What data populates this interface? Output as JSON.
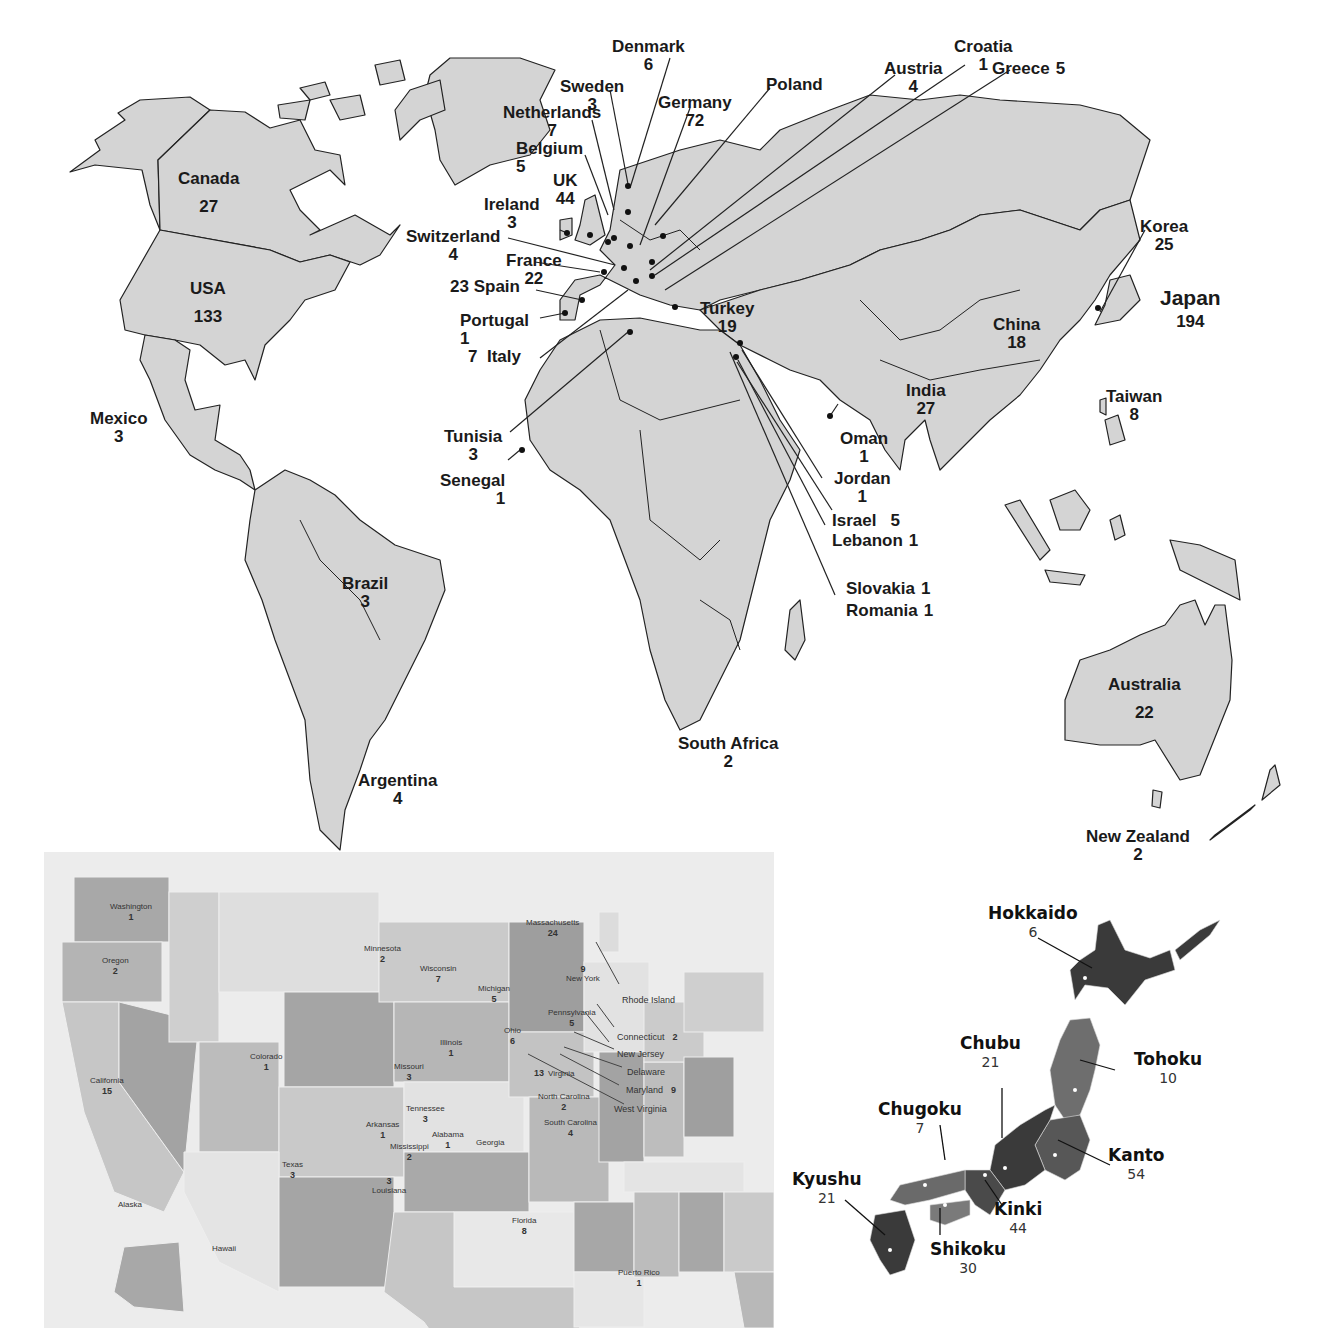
{
  "colors": {
    "land": "#d4d4d4",
    "border": "#222222",
    "ocean": "#ffffff",
    "usa_bg": "#ececec",
    "usa_shades": [
      "#bdbdbd",
      "#c8c8c8",
      "#d6d6d6",
      "#e2e2e2",
      "#b0b0b0"
    ],
    "japan_dark": "#3a3a3a",
    "japan_mid": "#5e5e5e",
    "japan_light": "#7a7a7a"
  },
  "world_map": {
    "countries": [
      {
        "name": "Canada",
        "count": "27"
      },
      {
        "name": "USA",
        "count": "133"
      },
      {
        "name": "Mexico",
        "count": "3"
      },
      {
        "name": "Brazil",
        "count": "3"
      },
      {
        "name": "Argentina",
        "count": "4"
      },
      {
        "name": "Denmark",
        "count": "6"
      },
      {
        "name": "Sweden",
        "count": "3"
      },
      {
        "name": "Netherlands",
        "count": "7"
      },
      {
        "name": "Belgium",
        "count": "5"
      },
      {
        "name": "UK",
        "count": "44"
      },
      {
        "name": "Ireland",
        "count": "3"
      },
      {
        "name": "Switzerland",
        "count": "4"
      },
      {
        "name": "France",
        "count": "22"
      },
      {
        "name": "Spain",
        "count": "23"
      },
      {
        "name": "Portugal",
        "count": "1"
      },
      {
        "name": "Italy",
        "count": "7"
      },
      {
        "name": "Germany",
        "count": "72"
      },
      {
        "name": "Poland",
        "count": ""
      },
      {
        "name": "Austria",
        "count": "4"
      },
      {
        "name": "Croatia",
        "count": "1"
      },
      {
        "name": "Greece",
        "count": "5"
      },
      {
        "name": "Turkey",
        "count": "19"
      },
      {
        "name": "Tunisia",
        "count": "3"
      },
      {
        "name": "Senegal",
        "count": "1"
      },
      {
        "name": "Oman",
        "count": "1"
      },
      {
        "name": "Jordan",
        "count": "1"
      },
      {
        "name": "Israel",
        "count": "5"
      },
      {
        "name": "Lebanon",
        "count": "1"
      },
      {
        "name": "Slovakia",
        "count": "1"
      },
      {
        "name": "Romania",
        "count": "1"
      },
      {
        "name": "South Africa",
        "count": "2"
      },
      {
        "name": "India",
        "count": "27"
      },
      {
        "name": "China",
        "count": "18"
      },
      {
        "name": "Korea",
        "count": "25"
      },
      {
        "name": "Japan",
        "count": "194"
      },
      {
        "name": "Taiwan",
        "count": "8"
      },
      {
        "name": "Australia",
        "count": "22"
      },
      {
        "name": "New Zealand",
        "count": "2"
      }
    ]
  },
  "usa_map": {
    "states": [
      {
        "name": "Washington",
        "count": "1"
      },
      {
        "name": "Oregon",
        "count": "2"
      },
      {
        "name": "California",
        "count": "15"
      },
      {
        "name": "Colorado",
        "count": "1"
      },
      {
        "name": "Minnesota",
        "count": "2"
      },
      {
        "name": "Wisconsin",
        "count": "7"
      },
      {
        "name": "Michigan",
        "count": "5"
      },
      {
        "name": "Illinois",
        "count": "1"
      },
      {
        "name": "Missouri",
        "count": "3"
      },
      {
        "name": "Ohio",
        "count": "6"
      },
      {
        "name": "Massachusetts",
        "count": "24"
      },
      {
        "name": "New York",
        "count": "9"
      },
      {
        "name": "Pennsylvania",
        "count": "5"
      },
      {
        "name": "Virginia",
        "count": "13"
      },
      {
        "name": "North Carolina",
        "count": "2"
      },
      {
        "name": "South Carolina",
        "count": "4"
      },
      {
        "name": "Tennessee",
        "count": "3"
      },
      {
        "name": "Arkansas",
        "count": "1"
      },
      {
        "name": "Mississippi",
        "count": "2"
      },
      {
        "name": "Alabama",
        "count": "1"
      },
      {
        "name": "Georgia",
        "count": ""
      },
      {
        "name": "Louisiana",
        "count": "3"
      },
      {
        "name": "Texas",
        "count": "3"
      },
      {
        "name": "Florida",
        "count": "8"
      },
      {
        "name": "Alaska",
        "count": ""
      },
      {
        "name": "Hawaii",
        "count": ""
      },
      {
        "name": "Puerto Rico",
        "count": "1"
      }
    ],
    "callouts": [
      {
        "name": "Rhode Island",
        "count": ""
      },
      {
        "name": "Connecticut",
        "count": "2"
      },
      {
        "name": "New Jersey",
        "count": ""
      },
      {
        "name": "Delaware",
        "count": ""
      },
      {
        "name": "Maryland",
        "count": "9"
      },
      {
        "name": "West Virginia",
        "count": ""
      }
    ]
  },
  "japan_map": {
    "regions": [
      {
        "name": "Hokkaido",
        "count": "6"
      },
      {
        "name": "Tohoku",
        "count": "10"
      },
      {
        "name": "Chubu",
        "count": "21"
      },
      {
        "name": "Kanto",
        "count": "54"
      },
      {
        "name": "Chugoku",
        "count": "7"
      },
      {
        "name": "Kinki",
        "count": "44"
      },
      {
        "name": "Kyushu",
        "count": "21"
      },
      {
        "name": "Shikoku",
        "count": "30"
      }
    ]
  }
}
